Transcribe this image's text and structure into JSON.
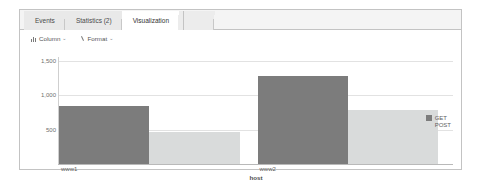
{
  "tabs": [
    {
      "label": "Events",
      "active": false
    },
    {
      "label": "Statistics (2)",
      "active": false
    },
    {
      "label": "Visualization",
      "active": true
    }
  ],
  "toolbar": {
    "column_label": "Column",
    "column_caret": "⌄",
    "format_label": "Format",
    "format_caret": "⌄",
    "column_icon": "bar-chart-icon",
    "format_icon": "brush-icon"
  },
  "chart_data": {
    "type": "bar",
    "title": "",
    "subtitle": "",
    "xlabel": "host",
    "ylabel": "",
    "categories": [
      "www1",
      "www2"
    ],
    "series": [
      {
        "name": "GET",
        "values": [
          845,
          1280
        ],
        "color": "#7c7c7c"
      },
      {
        "name": "POST",
        "values": [
          470,
          780
        ],
        "color": "#d9dbdb"
      }
    ],
    "ylim": [
      0,
      1700
    ],
    "yticks": [
      500,
      1000,
      1500
    ],
    "ytick_labels": [
      "500",
      "1,000",
      "1,500"
    ],
    "grid": true,
    "legend_position": "right",
    "legend_entries": [
      "GET",
      "POST"
    ]
  },
  "colors": {
    "get": "#7c7c7c",
    "post": "#d9dbdb",
    "grid": "#e2e2e2",
    "axis": "#b9b9b9",
    "panel_border": "#c3c3c3",
    "tab_active_bg": "#ffffff",
    "tab_bg": "#e9e9e9"
  }
}
